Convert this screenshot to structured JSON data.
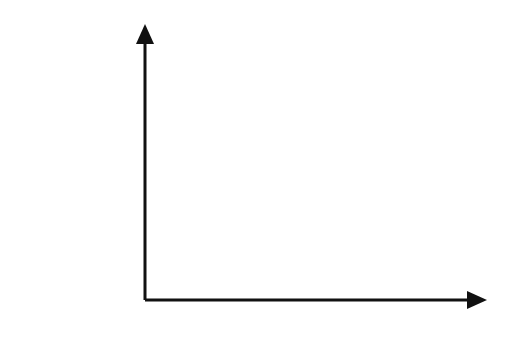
{
  "chart_data": {
    "type": "line",
    "title": "",
    "ylabel": "Activity A0",
    "ylabel_parts": {
      "text": "Activity ",
      "var": "A",
      "sub": "0"
    },
    "xlabel": "Time",
    "annotation": {
      "lhs": "A",
      "eq": " = ",
      "var": "A",
      "sub": "0",
      "base": "e",
      "exp": "−λt"
    },
    "equation": "A = A0 e^(−λt)",
    "series": [
      {
        "name": "A = A0 e^(-λt)",
        "x": [
          0,
          1,
          2,
          3,
          4
        ],
        "values": [
          1.0,
          0.5,
          0.25,
          0.12,
          0.06
        ]
      }
    ],
    "grid": true,
    "colors": {
      "curve": "#222222",
      "axis": "#111111",
      "grid_major": "#bbbbbb",
      "grid_minor": "#dddddd"
    }
  }
}
